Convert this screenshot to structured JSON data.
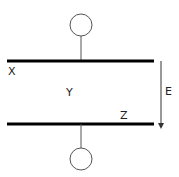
{
  "diagram": {
    "labels": {
      "top_plate": "X",
      "gap_region": "Y",
      "bottom_plate": "Z",
      "field": "E"
    },
    "colors": {
      "plate": "#000000",
      "wire": "#555555",
      "text": "#222222"
    }
  }
}
